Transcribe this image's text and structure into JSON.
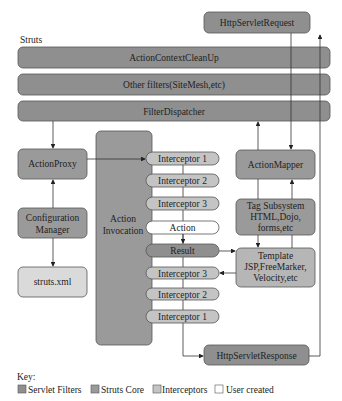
{
  "diagram": {
    "group_label": "Struts",
    "http_request": "HttpServletRequest",
    "http_response": "HttpServletResponse",
    "filters": [
      "ActionContextCleanUp",
      "Other filters(SiteMesh,etc)",
      "FilterDispatcher"
    ],
    "action_proxy": "ActionProxy",
    "configuration_manager": [
      "Configuration",
      "Manager"
    ],
    "struts_xml": "struts.xml",
    "action_invocation": [
      "Action",
      "Invocation"
    ],
    "interceptors_in": [
      "Interceptor 1",
      "Interceptor 2",
      "Interceptor 3"
    ],
    "action": "Action",
    "result": "Result",
    "interceptors_out": [
      "Interceptor 3",
      "Interceptor 2",
      "Interceptor 1"
    ],
    "action_mapper": "ActionMapper",
    "tag_subsystem": [
      "Tag Subsystem",
      "HTML,Dojo,",
      "forms,etc"
    ],
    "template": [
      "Template",
      "JSP,FreeMarker,",
      "Velocity,etc"
    ]
  },
  "key": {
    "title": "Key:",
    "items": [
      {
        "label": "Servlet Filters",
        "color": "#8f8f8f"
      },
      {
        "label": "Struts Core",
        "color": "#9a9a9a"
      },
      {
        "label": "Interceptors",
        "color": "#c4c4c4"
      },
      {
        "label": "User created",
        "color": "#ffffff"
      }
    ]
  }
}
